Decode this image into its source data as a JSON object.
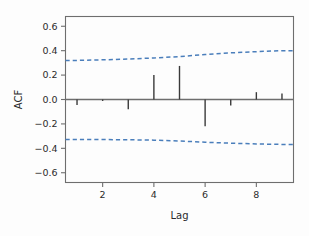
{
  "chart_data": {
    "type": "bar",
    "title": "",
    "subtitle": "",
    "xlabel": "Lag",
    "ylabel": "ACF",
    "x": [
      1,
      2,
      3,
      4,
      5,
      6,
      7,
      8,
      9
    ],
    "values": [
      -0.045,
      -0.012,
      -0.08,
      0.2,
      0.275,
      -0.22,
      -0.05,
      0.06,
      0.05
    ],
    "categories": [
      "1",
      "2",
      "3",
      "4",
      "5",
      "6",
      "7",
      "8",
      "9"
    ],
    "xlim": [
      0.55,
      9.45
    ],
    "ylim": [
      -0.68,
      0.68
    ],
    "xticks": [
      2,
      4,
      6,
      8
    ],
    "xticklabels": [
      "2",
      "4",
      "6",
      "8"
    ],
    "yticks": [
      0.6,
      0.4,
      0.2,
      0.0,
      -0.2,
      -0.4,
      -0.6
    ],
    "yticklabels": [
      "0.6",
      "0.4",
      "0.2",
      "0.0",
      "-0.2",
      "-0.4",
      "-0.6"
    ],
    "grid": false,
    "legend": "none",
    "zero_line": 0.0,
    "confidence_bands": {
      "style": "dashed",
      "color": "#4a7ebb",
      "upper": [
        0.32,
        0.325,
        0.332,
        0.34,
        0.352,
        0.368,
        0.382,
        0.392,
        0.4
      ],
      "lower": [
        -0.327,
        -0.328,
        -0.33,
        -0.333,
        -0.34,
        -0.35,
        -0.358,
        -0.364,
        -0.368
      ]
    },
    "series": [
      {
        "name": "ACF",
        "color": "#3a3a3a",
        "values": [
          -0.045,
          -0.012,
          -0.08,
          0.2,
          0.275,
          -0.22,
          -0.05,
          0.06,
          0.05
        ]
      }
    ]
  },
  "colors": {
    "bar": "#3a3a3a",
    "band": "#4a7ebb",
    "axis": "#6e6e6e",
    "text": "#2b2b2b",
    "background": "#fdfdfd"
  }
}
